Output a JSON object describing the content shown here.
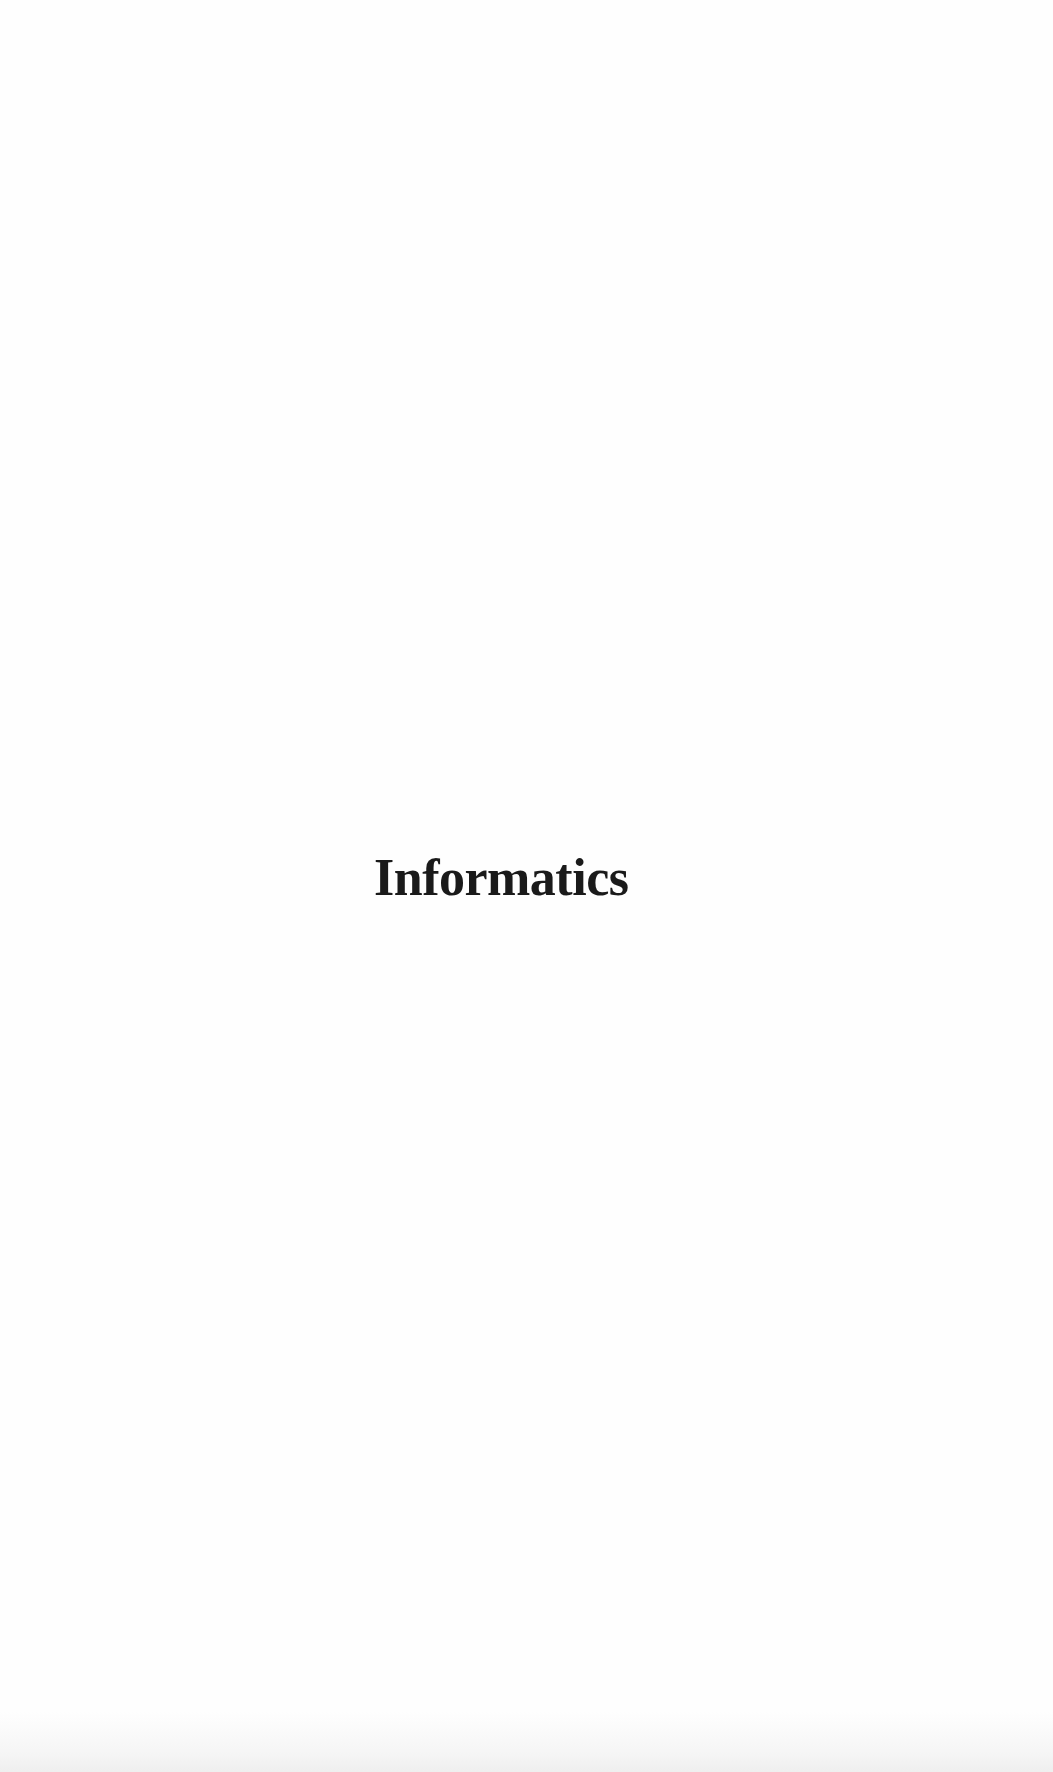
{
  "page": {
    "title": "Informatics"
  },
  "colors": {
    "background": "#fefefe",
    "text": "#1a1a1a"
  }
}
